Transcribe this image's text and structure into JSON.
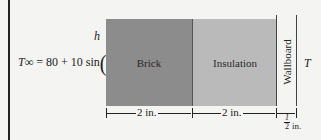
{
  "diagram": {
    "ambient_label": "h",
    "equation": {
      "lhs": "T∞",
      "rhs_prefix": "= 80 + 10 sin",
      "fraction_numerator": "πt",
      "fraction_denominator": "12"
    },
    "layers": [
      {
        "name": "Brick",
        "thickness": "2 in.",
        "color": "#8c8c8c"
      },
      {
        "name": "Insulation",
        "thickness": "2 in.",
        "color": "#bababa"
      },
      {
        "name": "Wallboard",
        "thickness_num": "1",
        "thickness_den": "2",
        "thickness_unit": "in."
      }
    ],
    "inner_temp_label": "T"
  }
}
